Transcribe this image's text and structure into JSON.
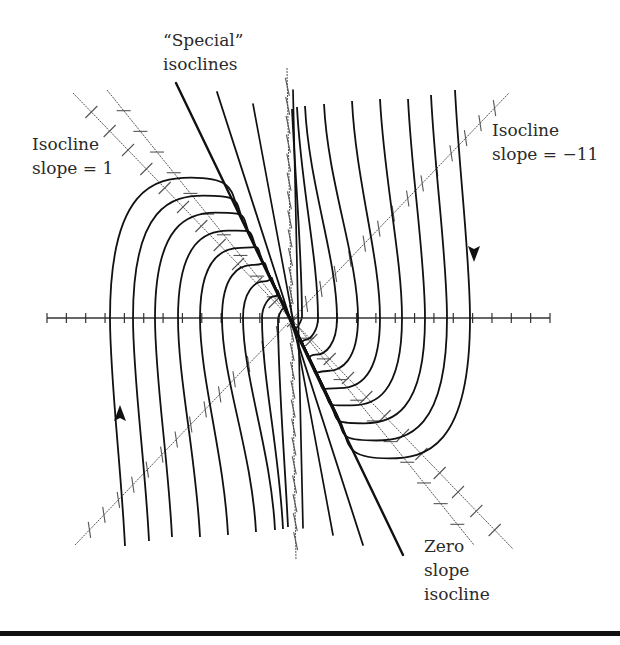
{
  "figure": {
    "labels": {
      "special": [
        "“Special”",
        "isoclines"
      ],
      "slope_one": [
        "Isocline",
        "slope = 1"
      ],
      "slope_minus_eleven": [
        "Isocline",
        "slope = −11"
      ],
      "zero_slope": [
        "Zero",
        "slope",
        "isocline"
      ]
    },
    "colors": {
      "trajectory": "#111111",
      "isocline": "#555555",
      "axis": "#333333",
      "text": "#2a2a2a",
      "rule": "#111111"
    }
  },
  "chart_data": {
    "type": "diagram",
    "title": "",
    "origin_px": [
      290,
      318
    ],
    "axes": {
      "x_axis_px": {
        "from": [
          47,
          318
        ],
        "to": [
          550,
          318
        ],
        "tick_spacing_px": 20
      },
      "y_axis_isocline_px": {
        "from": [
          287,
          68
        ],
        "to": [
          296,
          560
        ]
      }
    },
    "isoclines": [
      {
        "name": "Isocline slope = 1",
        "from": [
          73,
          93
        ],
        "to": [
          513,
          549
        ],
        "tick_style": "short slanted"
      },
      {
        "name": "Zero slope isocline",
        "from": [
          107,
          90
        ],
        "to": [
          474,
          545
        ],
        "tick_style": "horizontal dash"
      },
      {
        "name": "Isocline slope = −11",
        "from": [
          75,
          545
        ],
        "to": [
          509,
          93
        ],
        "tick_style": "near-vertical"
      },
      {
        "name": "Special isocline (thick)",
        "from": [
          176,
          83
        ],
        "to": [
          403,
          555
        ]
      }
    ],
    "trajectory_axis_crossings_px": {
      "left": [
        110,
        133,
        155,
        178,
        200,
        222,
        243,
        262,
        278
      ],
      "right": [
        302,
        318,
        340,
        363,
        388,
        408,
        431,
        453,
        478
      ]
    },
    "arrows": [
      {
        "direction": "up",
        "at": [
          120,
          415
        ]
      },
      {
        "direction": "down",
        "at": [
          474,
          252
        ]
      }
    ]
  }
}
